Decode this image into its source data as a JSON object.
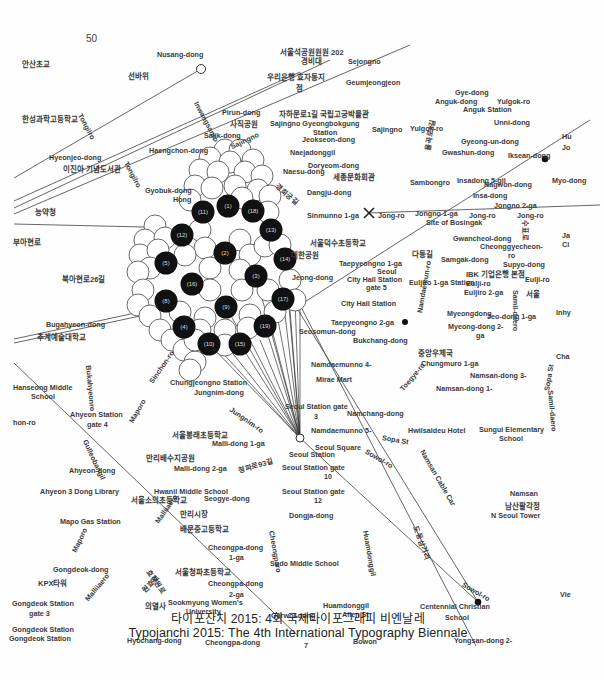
{
  "page": {
    "page_number": "50",
    "caption_korean": "타이포잔치 2015: 4회 국제타이포그래피 비엔날레",
    "caption_english": "Typojanchi 2015: The 4th International Typography Biennale"
  },
  "map": {
    "hub": {
      "name": "Seoul Station",
      "x": 300,
      "y": 438
    },
    "cluster_nodes": [
      {
        "id": "1",
        "x": 228,
        "y": 206
      },
      {
        "id": "2",
        "x": 225,
        "y": 253
      },
      {
        "id": "3",
        "x": 256,
        "y": 276
      },
      {
        "id": "4",
        "x": 184,
        "y": 327
      },
      {
        "id": "5",
        "x": 166,
        "y": 263
      },
      {
        "id": "8",
        "x": 166,
        "y": 301
      },
      {
        "id": "9",
        "x": 226,
        "y": 307
      },
      {
        "id": "10",
        "x": 209,
        "y": 344
      },
      {
        "id": "11",
        "x": 203,
        "y": 212
      },
      {
        "id": "12",
        "x": 182,
        "y": 235
      },
      {
        "id": "13",
        "x": 271,
        "y": 230
      },
      {
        "id": "14",
        "x": 285,
        "y": 259
      },
      {
        "id": "15",
        "x": 240,
        "y": 344
      },
      {
        "id": "16",
        "x": 192,
        "y": 284
      },
      {
        "id": "17",
        "x": 283,
        "y": 299
      },
      {
        "id": "18",
        "x": 253,
        "y": 211
      },
      {
        "id": "19",
        "x": 265,
        "y": 326
      }
    ],
    "markers": [
      {
        "type": "x-marker",
        "name": "Sinmunno 1-ga",
        "x": 369,
        "y": 213
      },
      {
        "type": "dot",
        "name": "Iksean-dong",
        "x": 545,
        "y": 159
      },
      {
        "type": "dot",
        "name": "Taepyeongno 2-ga",
        "x": 405,
        "y": 322
      },
      {
        "type": "dot",
        "name": "Centennial Christian School",
        "x": 478,
        "y": 602
      },
      {
        "type": "open-circle",
        "name": "Nusang-dong",
        "x": 201,
        "y": 69
      },
      {
        "type": "open-circle",
        "name": "Cheongparo",
        "x": 273,
        "y": 688
      }
    ],
    "labels": [
      {
        "text": "Nusang-dong",
        "x": 157,
        "y": 50
      },
      {
        "text": "서울석공원원원 202",
        "x": 280,
        "y": 48,
        "ko": true
      },
      {
        "text": "경비대",
        "x": 301,
        "y": 57,
        "ko": true
      },
      {
        "text": "Sejongno",
        "x": 348,
        "y": 57
      },
      {
        "text": "안산초교",
        "x": 22,
        "y": 60,
        "ko": true
      },
      {
        "text": "선바위",
        "x": 128,
        "y": 72,
        "ko": true
      },
      {
        "text": "우리은행 효자동지",
        "x": 267,
        "y": 73,
        "ko": true
      },
      {
        "text": "점",
        "x": 296,
        "y": 84,
        "ko": true
      },
      {
        "text": "Geumjeongjeon",
        "x": 346,
        "y": 78
      },
      {
        "text": "Gye-dong",
        "x": 455,
        "y": 88
      },
      {
        "text": "Anguk-dong",
        "x": 435,
        "y": 97
      },
      {
        "text": "Yulgok-ro",
        "x": 497,
        "y": 97
      },
      {
        "text": "Anguk Station",
        "x": 463,
        "y": 105
      },
      {
        "text": "Unni-dong",
        "x": 494,
        "y": 118
      },
      {
        "text": "Pirun-dong",
        "x": 222,
        "y": 108
      },
      {
        "text": "사직공원",
        "x": 230,
        "y": 120,
        "ko": true
      },
      {
        "text": "자하문로1길 국립고궁박물관",
        "x": 279,
        "y": 110,
        "ko": true
      },
      {
        "text": "Sajingno Gyeongbokgung",
        "x": 270,
        "y": 119
      },
      {
        "text": "Station",
        "x": 313,
        "y": 128
      },
      {
        "text": "Jeokseon-dong",
        "x": 302,
        "y": 135
      },
      {
        "text": "한성과학고등학교",
        "x": 22,
        "y": 115,
        "ko": true
      },
      {
        "text": "Sajik-dong",
        "x": 204,
        "y": 131
      },
      {
        "text": "Sajingno",
        "x": 372,
        "y": 125
      },
      {
        "text": "Yulgok-ro",
        "x": 410,
        "y": 124
      },
      {
        "text": "Gyeong-un-dong",
        "x": 461,
        "y": 137
      },
      {
        "text": "Haengchon-dong",
        "x": 149,
        "y": 146
      },
      {
        "text": "Naejadonggil",
        "x": 290,
        "y": 148
      },
      {
        "text": "Gwashun-dong",
        "x": 442,
        "y": 148
      },
      {
        "text": "Iksean-dong",
        "x": 508,
        "y": 151
      },
      {
        "text": "Hyeonjeo-dong",
        "x": 49,
        "y": 153
      },
      {
        "text": "Doryeom-dong",
        "x": 308,
        "y": 161
      },
      {
        "text": "이진아 기념도서관",
        "x": 63,
        "y": 165,
        "ko": true
      },
      {
        "text": "Naesu-dong",
        "x": 283,
        "y": 167
      },
      {
        "text": "세종문화회관",
        "x": 333,
        "y": 173,
        "ko": true
      },
      {
        "text": "Sambongro",
        "x": 410,
        "y": 178
      },
      {
        "text": "Insadong 5-gil",
        "x": 457,
        "y": 176
      },
      {
        "text": "Nagwon-dong",
        "x": 484,
        "y": 180
      },
      {
        "text": "Myo-dong",
        "x": 552,
        "y": 176
      },
      {
        "text": "Gyobuk-dong",
        "x": 145,
        "y": 186
      },
      {
        "text": "Dangju-dong",
        "x": 307,
        "y": 188
      },
      {
        "text": "Hong",
        "x": 173,
        "y": 195
      },
      {
        "text": "Insa-dong",
        "x": 473,
        "y": 191
      },
      {
        "text": "Jongno 2-ga",
        "x": 494,
        "y": 201
      },
      {
        "text": "능약청",
        "x": 35,
        "y": 208,
        "ko": true
      },
      {
        "text": "Sinmunno 1-ga",
        "x": 307,
        "y": 211
      },
      {
        "text": "Jong-ro",
        "x": 378,
        "y": 211
      },
      {
        "text": "Jongno 1-ga",
        "x": 415,
        "y": 209
      },
      {
        "text": "Site of Bosingak",
        "x": 426,
        "y": 218
      },
      {
        "text": "Jong-ro",
        "x": 469,
        "y": 211
      },
      {
        "text": "Jong-ro",
        "x": 517,
        "y": 211
      },
      {
        "text": "부아현로",
        "x": 13,
        "y": 238,
        "ko": true
      },
      {
        "text": "서울덕수초등학교",
        "x": 310,
        "y": 239,
        "ko": true
      },
      {
        "text": "Gwancheol-dong",
        "x": 453,
        "y": 234
      },
      {
        "text": "Cheonggyecheon-",
        "x": 480,
        "y": 242
      },
      {
        "text": "ro",
        "x": 508,
        "y": 251
      },
      {
        "text": "대한공원",
        "x": 291,
        "y": 251,
        "ko": true
      },
      {
        "text": "다동길",
        "x": 412,
        "y": 250,
        "ko": true
      },
      {
        "text": "Samgak-dong",
        "x": 441,
        "y": 255
      },
      {
        "text": "Taepyeongno 1-ga",
        "x": 339,
        "y": 259
      },
      {
        "text": "Supyo-dong",
        "x": 503,
        "y": 260
      },
      {
        "text": "Seoul",
        "x": 377,
        "y": 267
      },
      {
        "text": "IBK 기업은행 본점",
        "x": 466,
        "y": 270,
        "ko": true
      },
      {
        "text": "Jeong-dong",
        "x": 292,
        "y": 273
      },
      {
        "text": "City Hall Station",
        "x": 347,
        "y": 275
      },
      {
        "text": "Euljiro 1-ga Station",
        "x": 409,
        "y": 278
      },
      {
        "text": "Eulji-ro",
        "x": 466,
        "y": 279
      },
      {
        "text": "Eulji-ro",
        "x": 525,
        "y": 275
      },
      {
        "text": "북아현로26길",
        "x": 62,
        "y": 275,
        "ko": true
      },
      {
        "text": "gate 5",
        "x": 366,
        "y": 283
      },
      {
        "text": "Euljiro 2-ga",
        "x": 464,
        "y": 288
      },
      {
        "text": "서울",
        "x": 526,
        "y": 290,
        "ko": true
      },
      {
        "text": "City Hall Station",
        "x": 341,
        "y": 299
      },
      {
        "text": "Myeongdong",
        "x": 447,
        "y": 309
      },
      {
        "text": "Jeo-dong 1-ga",
        "x": 487,
        "y": 312
      },
      {
        "text": "Bugahyeon-dong",
        "x": 46,
        "y": 320
      },
      {
        "text": "Taepyeongno 2-ga",
        "x": 331,
        "y": 318
      },
      {
        "text": "Myeong-dong 2-",
        "x": 448,
        "y": 322
      },
      {
        "text": "Seosomun-dong",
        "x": 299,
        "y": 327
      },
      {
        "text": "ga",
        "x": 476,
        "y": 331
      },
      {
        "text": "추계예술대학교",
        "x": 37,
        "y": 333,
        "ko": true
      },
      {
        "text": "Bukchang-dong",
        "x": 353,
        "y": 336
      },
      {
        "text": "Hanseong Middle",
        "x": 13,
        "y": 383
      },
      {
        "text": "School",
        "x": 31,
        "y": 392
      },
      {
        "text": "중앙우체국",
        "x": 418,
        "y": 349,
        "ko": true
      },
      {
        "text": "Chungmuro 1-ga",
        "x": 421,
        "y": 359
      },
      {
        "text": "Cha",
        "x": 556,
        "y": 352
      },
      {
        "text": "Namdaemunno 4-",
        "x": 311,
        "y": 360
      },
      {
        "text": "Mirae Mart",
        "x": 316,
        "y": 375
      },
      {
        "text": "Namsan-dong 3-",
        "x": 470,
        "y": 371
      },
      {
        "text": "Ahyeon Station",
        "x": 70,
        "y": 410
      },
      {
        "text": "gate 4",
        "x": 87,
        "y": 420
      },
      {
        "text": "Namsan-dong 1-",
        "x": 436,
        "y": 384
      },
      {
        "text": "Chungjeongno Station",
        "x": 170,
        "y": 378
      },
      {
        "text": "Jungnim-dong",
        "x": 194,
        "y": 388
      },
      {
        "text": "hon-ro",
        "x": 13,
        "y": 418
      },
      {
        "text": "Seoul Station gate",
        "x": 285,
        "y": 402
      },
      {
        "text": "3",
        "x": 314,
        "y": 412
      },
      {
        "text": "Namchang-dong",
        "x": 347,
        "y": 409
      },
      {
        "text": "Hwilsaideu Hotel",
        "x": 408,
        "y": 426
      },
      {
        "text": "Sungui Elementary",
        "x": 479,
        "y": 425
      },
      {
        "text": "School",
        "x": 499,
        "y": 434
      },
      {
        "text": "서울봉래초등학교",
        "x": 172,
        "y": 431,
        "ko": true
      },
      {
        "text": "Namdaemunno 5-",
        "x": 311,
        "y": 426
      },
      {
        "text": "Malli-dong 1-ga",
        "x": 212,
        "y": 439
      },
      {
        "text": "Seoul Square",
        "x": 315,
        "y": 443
      },
      {
        "text": "Seoul Station",
        "x": 289,
        "y": 450
      },
      {
        "text": "만리배수지공원",
        "x": 146,
        "y": 454,
        "ko": true
      },
      {
        "text": "Malli-dong 2-ga",
        "x": 174,
        "y": 464
      },
      {
        "text": "Ahyeon-dong",
        "x": 69,
        "y": 466
      },
      {
        "text": "Seoul Station gate",
        "x": 282,
        "y": 463
      },
      {
        "text": "10",
        "x": 324,
        "y": 472
      },
      {
        "text": "Ahyeon 3 Dong Library",
        "x": 40,
        "y": 487
      },
      {
        "text": "Hwanil Middle School",
        "x": 154,
        "y": 487
      },
      {
        "text": "서울소의초등학교",
        "x": 131,
        "y": 496,
        "ko": true
      },
      {
        "text": "Seogye-dong",
        "x": 204,
        "y": 494
      },
      {
        "text": "Seoul Station gate",
        "x": 282,
        "y": 487
      },
      {
        "text": "12",
        "x": 314,
        "y": 496
      },
      {
        "text": "Namsan",
        "x": 510,
        "y": 489
      },
      {
        "text": "남산팔각정",
        "x": 505,
        "y": 502,
        "ko": true
      },
      {
        "text": "N Seoul Tower",
        "x": 491,
        "y": 511
      },
      {
        "text": "만리시장",
        "x": 180,
        "y": 510,
        "ko": true
      },
      {
        "text": "Dongja-dong",
        "x": 289,
        "y": 511
      },
      {
        "text": "Mapo Gas Station",
        "x": 60,
        "y": 517
      },
      {
        "text": "배문중고등학교",
        "x": 180,
        "y": 525,
        "ko": true
      },
      {
        "text": "Cheongpa-dong",
        "x": 208,
        "y": 543
      },
      {
        "text": "1-ga",
        "x": 229,
        "y": 553
      },
      {
        "text": "Gongdeok-dong",
        "x": 53,
        "y": 565
      },
      {
        "text": "Sudo Middle School",
        "x": 270,
        "y": 559
      },
      {
        "text": "KPX타워",
        "x": 38,
        "y": 579,
        "ko": true
      },
      {
        "text": "서울청파초등학교",
        "x": 175,
        "y": 568,
        "ko": true
      },
      {
        "text": "Cheongpa-dong",
        "x": 208,
        "y": 579
      },
      {
        "text": "2-ga",
        "x": 229,
        "y": 590
      },
      {
        "text": "Gongdeok Station",
        "x": 12,
        "y": 599
      },
      {
        "text": "gate 3",
        "x": 29,
        "y": 609
      },
      {
        "text": "의열사",
        "x": 145,
        "y": 602,
        "ko": true
      },
      {
        "text": "Sookmyung Women's",
        "x": 168,
        "y": 598
      },
      {
        "text": "University",
        "x": 186,
        "y": 607
      },
      {
        "text": "Centennial Christian",
        "x": 420,
        "y": 602
      },
      {
        "text": "School",
        "x": 445,
        "y": 613
      },
      {
        "text": "Huamdonggil",
        "x": 323,
        "y": 601
      },
      {
        "text": "Allen St",
        "x": 342,
        "y": 610
      },
      {
        "text": "Garwol-dong",
        "x": 271,
        "y": 611
      },
      {
        "text": "Gongdeok Station",
        "x": 12,
        "y": 625
      },
      {
        "text": "Gongdeok Station",
        "x": 9,
        "y": 634
      },
      {
        "text": "Hyochang-dong",
        "x": 127,
        "y": 636
      },
      {
        "text": "Cheongpa-dong",
        "x": 205,
        "y": 638
      },
      {
        "text": "Vie",
        "x": 560,
        "y": 590
      },
      {
        "text": "Hu",
        "x": 562,
        "y": 132
      },
      {
        "text": "Jo",
        "x": 562,
        "y": 143
      },
      {
        "text": "Ja",
        "x": 562,
        "y": 231
      },
      {
        "text": "Ci",
        "x": 562,
        "y": 240
      },
      {
        "text": "Inhy",
        "x": 556,
        "y": 308
      },
      {
        "text": "Yongsan-dong 2-",
        "x": 454,
        "y": 636
      },
      {
        "text": "7",
        "x": 304,
        "y": 641
      },
      {
        "text": "Bowon",
        "x": 353,
        "y": 637
      }
    ],
    "rotated_labels": [
      {
        "text": "Tongilro",
        "x": 84,
        "y": 112,
        "angle": 62
      },
      {
        "text": "Inwangsanro",
        "x": 200,
        "y": 100,
        "angle": 62
      },
      {
        "text": "Sajingno",
        "x": 229,
        "y": 143,
        "angle": -25
      },
      {
        "text": "Tongilro",
        "x": 130,
        "y": 160,
        "angle": 62
      },
      {
        "text": "경희궁길",
        "x": 279,
        "y": 182,
        "angle": 40
      },
      {
        "text": "율곡로3길",
        "x": 423,
        "y": 150,
        "angle": -80
      },
      {
        "text": "Bukahyeonro",
        "x": 93,
        "y": 365,
        "angle": 85
      },
      {
        "text": "Sinchon-ro",
        "x": 147,
        "y": 380,
        "angle": -55
      },
      {
        "text": "Jungnim-ro",
        "x": 233,
        "y": 405,
        "angle": 35
      },
      {
        "text": "Maporo",
        "x": 127,
        "y": 420,
        "angle": -60
      },
      {
        "text": "Gulleobangil",
        "x": 89,
        "y": 438,
        "angle": 65
      },
      {
        "text": "청파로93길",
        "x": 237,
        "y": 466,
        "angle": -15
      },
      {
        "text": "Toegye-ro",
        "x": 398,
        "y": 387,
        "angle": -50
      },
      {
        "text": "Sopa St",
        "x": 383,
        "y": 433,
        "angle": 10
      },
      {
        "text": "Sowol-ro",
        "x": 368,
        "y": 447,
        "angle": 30
      },
      {
        "text": "Sopa St",
        "x": 542,
        "y": 390,
        "angle": -80
      },
      {
        "text": "Namsan Cable Car",
        "x": 426,
        "y": 448,
        "angle": 60
      },
      {
        "text": "Samil-daero",
        "x": 555,
        "y": 390,
        "angle": 85
      },
      {
        "text": "Namdaemun-ro",
        "x": 415,
        "y": 312,
        "angle": -80
      },
      {
        "text": "Samil-daero",
        "x": 520,
        "y": 290,
        "angle": 90
      },
      {
        "text": "Malliiaero",
        "x": 153,
        "y": 520,
        "angle": -55
      },
      {
        "text": "Cheongparo",
        "x": 276,
        "y": 530,
        "angle": 80
      },
      {
        "text": "Huamdonggil",
        "x": 370,
        "y": 530,
        "angle": 80
      },
      {
        "text": "도동삼거리",
        "x": 420,
        "y": 525,
        "angle": 70
      },
      {
        "text": "Sowol-ro",
        "x": 465,
        "y": 580,
        "angle": 30
      },
      {
        "text": "Maporo",
        "x": 70,
        "y": 550,
        "angle": -65
      },
      {
        "text": "효창원로",
        "x": 152,
        "y": 568,
        "angle": 55
      },
      {
        "text": "원효로",
        "x": 140,
        "y": 588,
        "angle": -45
      },
      {
        "text": "Malliiaero",
        "x": 83,
        "y": 597,
        "angle": -50
      },
      {
        "text": "수표로",
        "x": 530,
        "y": 220,
        "angle": 90
      }
    ]
  }
}
